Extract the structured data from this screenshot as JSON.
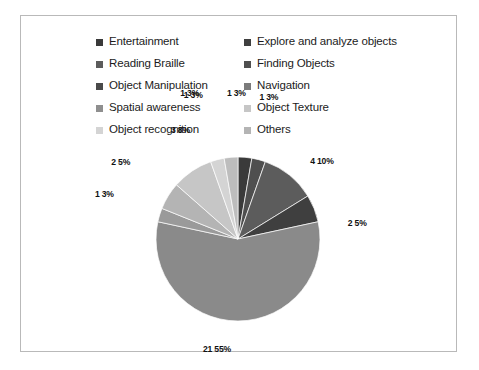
{
  "chart_data": {
    "type": "pie",
    "title": "",
    "legend_position": "top",
    "grid": false,
    "total_count": 37,
    "categories": [
      "Entertainment",
      "Explore and analyze objects",
      "Reading Braille",
      "Finding Objects",
      "Object Manipulation",
      "Navigation",
      "Spatial awareness",
      "Object Texture",
      "Object recognition",
      "Others"
    ],
    "values": [
      1,
      1,
      4,
      2,
      21,
      1,
      2,
      3,
      1,
      1
    ],
    "percents": [
      3,
      3,
      10,
      5,
      55,
      3,
      5,
      8,
      3,
      3
    ],
    "data_labels": [
      "1  3%",
      "1  3%",
      "4  10%",
      "2  5%",
      "21  55%",
      "1  3%",
      "2  5%",
      "3  8%",
      "1  3%",
      "1  3%"
    ],
    "colors": [
      "#3a3a3a",
      "#4f4f4f",
      "#5c5c5c",
      "#3f3f3f",
      "#8a8a8a",
      "#9a9a9a",
      "#b4b4b4",
      "#c6c6c6",
      "#d4d4d4",
      "#bdbdbd"
    ]
  },
  "legend": {
    "columns": [
      {
        "items": [
          {
            "label": "Entertainment",
            "color": "#3a3a3a"
          },
          {
            "label": "Reading Braille",
            "color": "#5c5c5c"
          },
          {
            "label": "Object Manipulation",
            "color": "#4a4a4a"
          },
          {
            "label": "Spatial awareness",
            "color": "#8f8f8f"
          },
          {
            "label": "Object recognition",
            "color": "#d4d4d4"
          }
        ]
      },
      {
        "items": [
          {
            "label": "Explore and analyze objects",
            "color": "#3f3f3f"
          },
          {
            "label": "Finding Objects",
            "color": "#4f4f4f"
          },
          {
            "label": "Navigation",
            "color": "#7b7b7b"
          },
          {
            "label": "Object Texture",
            "color": "#c6c6c6"
          },
          {
            "label": "Others",
            "color": "#b4b4b4"
          }
        ]
      }
    ]
  },
  "pie_geometry": {
    "cx": 217,
    "cy": 223,
    "r": 82,
    "start_angle_deg": -90
  },
  "label_offsets": [
    {
      "i": 0,
      "dx": -6,
      "dy": -92,
      "anchor": "middle"
    },
    {
      "i": 1,
      "dx": 18,
      "dy": -90,
      "anchor": "middle"
    },
    {
      "i": 2,
      "dx": 52,
      "dy": -35,
      "anchor": "middle"
    },
    {
      "i": 3,
      "dx": 72,
      "dy": 6,
      "anchor": "middle"
    },
    {
      "i": 4,
      "dx": -21,
      "dy": 62,
      "anchor": "middle"
    },
    {
      "i": 5,
      "dx": -85,
      "dy": -27,
      "anchor": "middle"
    },
    {
      "i": 6,
      "dx": -74,
      "dy": -47,
      "anchor": "middle"
    },
    {
      "i": 7,
      "dx": -29,
      "dy": -64,
      "anchor": "middle"
    },
    {
      "i": 8,
      "dx": -32,
      "dy": -92,
      "anchor": "middle"
    },
    {
      "i": 9,
      "dx": -44,
      "dy": -92,
      "anchor": "middle"
    }
  ]
}
